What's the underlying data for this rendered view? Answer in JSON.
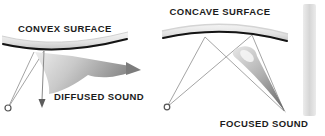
{
  "diagram": {
    "left_panel": {
      "title": "CONVEX SURFACE",
      "caption": "DIFFUSED SOUND"
    },
    "right_panel": {
      "title": "CONCAVE SURFACE",
      "caption": "FOCUSED SOUND"
    },
    "icons": [
      "sound-source-icon (small open circle, both panels)",
      "arrow-down-icon (reflected ray, left panel)",
      "arrow-right-icon (diffused wedge tip, left panel)",
      "focus-wedge-icon (converging wedge tip, right panel)"
    ],
    "colors": {
      "background": "#ffffff",
      "surface_edge": "#141414",
      "surface_fill_light": "#f2f2f2",
      "surface_fill_dark": "#c2c2c2",
      "ray_line": "#9a9a9a",
      "wedge_light": "#e6e6e6",
      "wedge_dark": "#7a7a7a",
      "text": "#1c1c1c",
      "side_bar": "#dcdcdc"
    }
  }
}
